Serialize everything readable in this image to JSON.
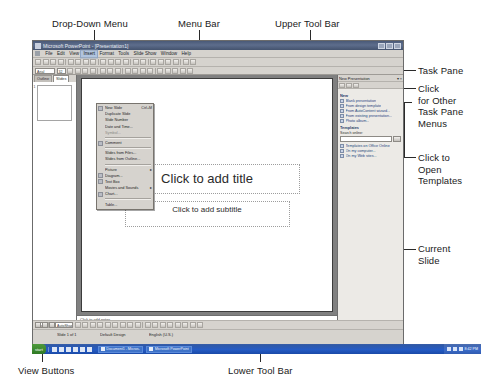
{
  "annotations": {
    "drop_down_menu": "Drop-Down Menu",
    "menu_bar": "Menu Bar",
    "upper_tool_bar": "Upper Tool Bar",
    "task_pane": "Task Pane",
    "other_task_pane_menus": "Click\nfor Other\nTask Pane\nMenus",
    "open_templates": "Click to\nOpen\nTemplates",
    "current_slide": "Current\nSlide",
    "view_buttons": "View Buttons",
    "lower_tool_bar": "Lower Tool Bar"
  },
  "window": {
    "title": "Microsoft PowerPoint - [Presentation1]",
    "minimize_label": "_",
    "restore_label": "□",
    "close_label": "×"
  },
  "menu_bar": {
    "items": [
      {
        "label": "File",
        "active": false
      },
      {
        "label": "Edit",
        "active": false
      },
      {
        "label": "View",
        "active": false
      },
      {
        "label": "Insert",
        "active": true
      },
      {
        "label": "Format",
        "active": false
      },
      {
        "label": "Tools",
        "active": false
      },
      {
        "label": "Slide Show",
        "active": false
      },
      {
        "label": "Window",
        "active": false
      },
      {
        "label": "Help",
        "active": false
      }
    ]
  },
  "toolbar_upper": {
    "font_name": "Arial",
    "font_size": "32",
    "button_count": 22
  },
  "toolbar_format": {
    "button_count": 20
  },
  "toolbar_lower": {
    "draw_label": "Draw",
    "autoshapes_label": "AutoShapes",
    "button_count": 20
  },
  "dropdown_menu": {
    "title": "Insert",
    "items": [
      {
        "label": "New Slide",
        "accel": "Ctrl+M",
        "icon": true,
        "submenu": false,
        "separator_after": false,
        "dim": false
      },
      {
        "label": "Duplicate Slide",
        "accel": "",
        "icon": false,
        "submenu": false,
        "separator_after": false,
        "dim": false
      },
      {
        "label": "Slide Number",
        "accel": "",
        "icon": false,
        "submenu": false,
        "separator_after": false,
        "dim": false
      },
      {
        "label": "Date and Time...",
        "accel": "",
        "icon": false,
        "submenu": false,
        "separator_after": false,
        "dim": false
      },
      {
        "label": "Symbol...",
        "accel": "",
        "icon": false,
        "submenu": false,
        "separator_after": true,
        "dim": true
      },
      {
        "label": "Comment",
        "accel": "",
        "icon": true,
        "submenu": false,
        "separator_after": true,
        "dim": false
      },
      {
        "label": "Slides from Files...",
        "accel": "",
        "icon": false,
        "submenu": false,
        "separator_after": false,
        "dim": false
      },
      {
        "label": "Slides from Outline...",
        "accel": "",
        "icon": false,
        "submenu": false,
        "separator_after": true,
        "dim": false
      },
      {
        "label": "Picture",
        "accel": "",
        "icon": false,
        "submenu": true,
        "separator_after": false,
        "dim": false
      },
      {
        "label": "Diagram...",
        "accel": "",
        "icon": true,
        "submenu": false,
        "separator_after": false,
        "dim": false
      },
      {
        "label": "Text Box",
        "accel": "",
        "icon": true,
        "submenu": false,
        "separator_after": false,
        "dim": false
      },
      {
        "label": "Movies and Sounds",
        "accel": "",
        "icon": false,
        "submenu": true,
        "separator_after": false,
        "dim": false
      },
      {
        "label": "Chart...",
        "accel": "",
        "icon": true,
        "submenu": false,
        "separator_after": true,
        "dim": false
      },
      {
        "label": "Table...",
        "accel": "",
        "icon": false,
        "submenu": false,
        "separator_after": false,
        "dim": false
      },
      {
        "label": "Object...",
        "accel": "",
        "icon": false,
        "submenu": false,
        "separator_after": false,
        "dim": false
      },
      {
        "label": "Hyperlink...",
        "accel": "Ctrl+K",
        "icon": true,
        "submenu": false,
        "separator_after": false,
        "dim": false
      }
    ]
  },
  "left_pane": {
    "tabs": [
      {
        "label": "Outline",
        "selected": false
      },
      {
        "label": "Slides",
        "selected": true
      }
    ],
    "thumbnail_number": "1"
  },
  "slide": {
    "title_placeholder": "Click to add title",
    "subtitle_placeholder": "Click to add subtitle"
  },
  "notes": {
    "placeholder": "Click to add notes"
  },
  "task_pane": {
    "title": "New Presentation",
    "close_label": "×",
    "dropdown_label": "▾",
    "nav_buttons": [
      "back-arrow",
      "forward-arrow",
      "home-icon"
    ],
    "sections": [
      {
        "heading": "New",
        "links": [
          "Blank presentation",
          "From design template",
          "From AutoContent wizard...",
          "From existing presentation...",
          "Photo album..."
        ]
      },
      {
        "heading": "Templates",
        "search_label": "Search online:",
        "search_value": "",
        "go_label": "Go",
        "links": [
          "Templates on Office Online",
          "On my computer...",
          "On my Web sites..."
        ]
      }
    ]
  },
  "status_bar": {
    "slide_count": "Slide 1 of 1",
    "design_name": "Default Design",
    "language": "English (U.S.)"
  },
  "view_buttons": {
    "buttons": [
      "normal-view-icon",
      "slide-sorter-view-icon",
      "slide-show-view-icon"
    ]
  },
  "taskbar": {
    "start_label": "start",
    "tasks": [
      "Document1 - Micros...",
      "Microsoft PowerPoint..."
    ],
    "clock": "8:42 PM"
  }
}
